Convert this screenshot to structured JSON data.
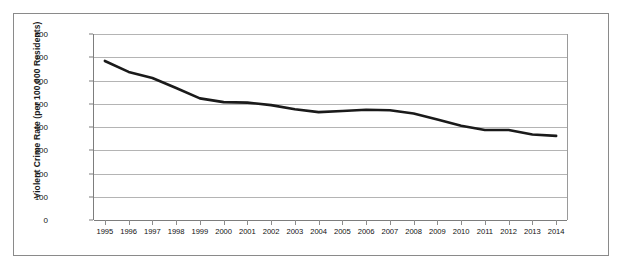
{
  "chart_data": {
    "type": "line",
    "title": "",
    "xlabel": "",
    "ylabel": "Violent Crime Rate (per 100,000 Residents)",
    "categories": [
      "1995",
      "1996",
      "1997",
      "1998",
      "1999",
      "2000",
      "2001",
      "2002",
      "2003",
      "2004",
      "2005",
      "2006",
      "2007",
      "2008",
      "2009",
      "2010",
      "2011",
      "2012",
      "2013",
      "2014"
    ],
    "x": [
      1995,
      1996,
      1997,
      1998,
      1999,
      2000,
      2001,
      2002,
      2003,
      2004,
      2005,
      2006,
      2007,
      2008,
      2009,
      2010,
      2011,
      2012,
      2013,
      2014
    ],
    "series": [
      {
        "name": "Violent Crime Rate",
        "color": "#1a1a1a",
        "values": [
          684,
          637,
          611,
          568,
          523,
          507,
          505,
          494,
          476,
          464,
          469,
          474,
          472,
          458,
          432,
          405,
          387,
          387,
          368,
          362
        ]
      }
    ],
    "ylim": [
      0,
      800
    ],
    "ytick_values": [
      0,
      100,
      200,
      300,
      400,
      500,
      600,
      700,
      800
    ],
    "ytick_labels": [
      "0",
      "100",
      "200",
      "300",
      "400",
      "500",
      "600",
      "700",
      "800"
    ],
    "grid": true,
    "grid_axis": "y",
    "legend": false,
    "legend_position": "none"
  },
  "style": {
    "line_color": "#1a1a1a",
    "grid_color": "#b4b4b4",
    "axis_color": "#7d7d7d",
    "frame_color": "#8a8a8a",
    "background": "#ffffff"
  }
}
